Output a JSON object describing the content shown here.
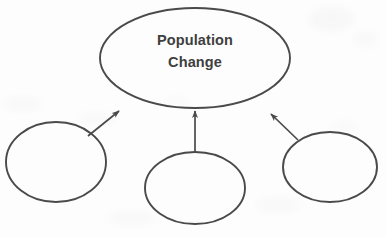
{
  "figure": {
    "kind": "concept-map",
    "background_color": "#fdfdfd",
    "stroke_color": "#4a4a4a",
    "text_color": "#3f3f3f",
    "width": 386,
    "height": 237
  },
  "nodes": [
    {
      "id": "main",
      "role": "central-concept",
      "line1": "Population",
      "line2": "Change",
      "cx": 195,
      "cy": 58,
      "rx": 95,
      "ry": 50,
      "filled": false
    },
    {
      "id": "left",
      "role": "cause-blank",
      "line1": "",
      "line2": "",
      "cx": 56,
      "cy": 162,
      "rx": 50,
      "ry": 40,
      "filled": false
    },
    {
      "id": "middle",
      "role": "cause-blank",
      "line1": "",
      "line2": "",
      "cx": 195,
      "cy": 188,
      "rx": 50,
      "ry": 36,
      "filled": false
    },
    {
      "id": "right",
      "role": "cause-blank",
      "line1": "",
      "line2": "",
      "cx": 330,
      "cy": 167,
      "rx": 47,
      "ry": 35,
      "filled": false
    }
  ],
  "arrows": [
    {
      "id": "left-to-main",
      "from": "left",
      "to": "main",
      "direction": "up-right",
      "x1": 88,
      "y1": 136,
      "x2": 119,
      "y2": 111
    },
    {
      "id": "middle-to-main",
      "from": "middle",
      "to": "main",
      "direction": "up",
      "x1": 195,
      "y1": 152,
      "x2": 195,
      "y2": 111
    },
    {
      "id": "right-to-main",
      "from": "right",
      "to": "main",
      "direction": "up-left",
      "x1": 298,
      "y1": 140,
      "x2": 271,
      "y2": 114
    }
  ]
}
